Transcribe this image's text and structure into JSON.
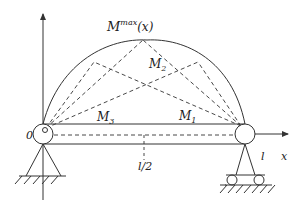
{
  "diagram": {
    "title_label": {
      "base": "M",
      "sup": "max",
      "suffix": "(x)"
    },
    "moment_labels": [
      {
        "base": "M",
        "sub": "1"
      },
      {
        "base": "M",
        "sub": "2"
      },
      {
        "base": "M",
        "sub": "3"
      }
    ],
    "origin_label": "0",
    "x_axis_label": "x",
    "span_label": "l",
    "midspan_label": "l/2",
    "colors": {
      "line": "#333333",
      "background": "#ffffff"
    }
  }
}
